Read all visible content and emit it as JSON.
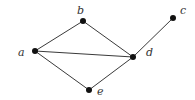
{
  "graph": {
    "nodes": [
      {
        "id": "a",
        "label": "a",
        "x": 35,
        "y": 51,
        "lx": 18,
        "ly": 56
      },
      {
        "id": "b",
        "label": "b",
        "x": 83,
        "y": 21,
        "lx": 77,
        "ly": 14
      },
      {
        "id": "c",
        "label": "c",
        "x": 173,
        "y": 18,
        "lx": 180,
        "ly": 14
      },
      {
        "id": "d",
        "label": "d",
        "x": 133,
        "y": 57,
        "lx": 146,
        "ly": 56
      },
      {
        "id": "e",
        "label": "e",
        "x": 89,
        "y": 90,
        "lx": 97,
        "ly": 95
      }
    ],
    "edges": [
      [
        "a",
        "b"
      ],
      [
        "a",
        "d"
      ],
      [
        "a",
        "e"
      ],
      [
        "b",
        "d"
      ],
      [
        "e",
        "d"
      ],
      [
        "d",
        "c"
      ]
    ]
  }
}
